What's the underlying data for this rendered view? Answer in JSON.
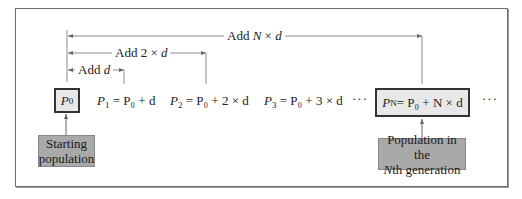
{
  "diagram": {
    "type": "arithmetic-growth-model",
    "labels": {
      "add_n_d": {
        "prefix": "Add ",
        "var_n": "N",
        "op": " × ",
        "var_d": "d"
      },
      "add_2_d": {
        "prefix": "Add 2 × ",
        "var_d": "d"
      },
      "add_d": {
        "prefix": "Add ",
        "var_d": "d"
      }
    },
    "terms": [
      {
        "id": "P0",
        "var": "P",
        "sub": "0",
        "boxed": true
      },
      {
        "id": "P1",
        "var": "P",
        "sub": "1",
        "rhs": " = P₀ + d"
      },
      {
        "id": "P2",
        "var": "P",
        "sub": "2",
        "rhs": " = P₀ + 2 × d"
      },
      {
        "id": "P3",
        "var": "P",
        "sub": "3",
        "rhs": " = P₀ + 3 × d"
      },
      {
        "id": "PN",
        "var": "P",
        "sub": "N",
        "rhs": " = P₀ + N × d",
        "boxed": true
      }
    ],
    "ellipsis": "···",
    "callouts": {
      "start": {
        "line1": "Starting",
        "line2": "population"
      },
      "nth": {
        "line1": "Population in the",
        "line2_var": "N",
        "line2_rest": "th generation"
      }
    },
    "colors": {
      "box_fill": "#e8e8e8",
      "callout_fill": "#a9a9a9",
      "line": "#8c8c8c",
      "border": "#333333"
    }
  }
}
